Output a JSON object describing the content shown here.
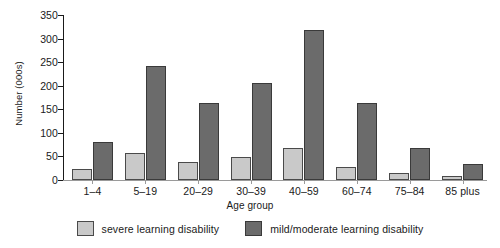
{
  "chart_data": {
    "type": "bar",
    "title": "",
    "xlabel": "Age group",
    "ylabel": "Number (000s)",
    "ylim": [
      0,
      350
    ],
    "yticks": [
      0,
      50,
      100,
      150,
      200,
      250,
      300,
      350
    ],
    "ytick_labels": [
      "0",
      "50",
      "100",
      "150",
      "200",
      "250",
      "300",
      "350"
    ],
    "grid": false,
    "legend_position": "bottom",
    "categories": [
      "1–4",
      "5–19",
      "20–29",
      "30–39",
      "40–59",
      "60–74",
      "75–84",
      "85 plus"
    ],
    "series": [
      {
        "name": "severe learning disability",
        "color": "#c9c9c9",
        "values": [
          23,
          58,
          38,
          49,
          68,
          28,
          15,
          9
        ]
      },
      {
        "name": "mild/moderate learning disability",
        "color": "#6b6b6b",
        "values": [
          81,
          242,
          164,
          205,
          318,
          164,
          68,
          35
        ]
      }
    ]
  },
  "axes": {
    "y_title": "Number (000s)",
    "x_title": "Age group"
  }
}
